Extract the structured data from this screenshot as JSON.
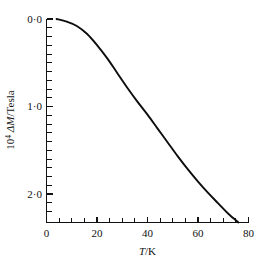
{
  "chart_data": {
    "type": "line",
    "title": "",
    "subtitle": "",
    "xlabel": "T/K",
    "xlabel_parts": {
      "symbol": "T",
      "separator": "/",
      "unit": "K"
    },
    "ylabel": "10⁴ ΔM / Tesla",
    "ylabel_parts": {
      "coefficient": "10",
      "exponent": "4",
      "quantity": "ΔM",
      "separator": "/",
      "unit": "Tesla"
    },
    "xlim": [
      0,
      80
    ],
    "ylim": [
      2.34,
      0.0
    ],
    "y_axis_inverted": true,
    "grid": false,
    "legend": false,
    "legend_position": "none",
    "xticks": [
      0,
      20,
      40,
      60,
      80
    ],
    "xticklabels": [
      "0",
      "20",
      "40",
      "60",
      "80"
    ],
    "x_minor_tick_step": 5,
    "yticks": [
      0.0,
      1.0,
      2.0
    ],
    "yticklabels": [
      "0·0",
      "1·0",
      "2·0"
    ],
    "y_minor_tick_step": 0.1,
    "axis_style": "left-and-bottom-spines",
    "curve_color": "#0d0d0d",
    "background_color": "#ffffff",
    "series": [
      {
        "name": "ΔM vs T",
        "x": [
          4,
          8,
          12,
          16,
          20,
          24,
          28,
          32,
          36,
          40,
          44,
          48,
          52,
          56,
          60,
          64,
          68,
          72,
          76
        ],
        "y": [
          0.0,
          0.03,
          0.08,
          0.17,
          0.3,
          0.45,
          0.62,
          0.79,
          0.95,
          1.1,
          1.26,
          1.42,
          1.58,
          1.73,
          1.87,
          2.0,
          2.12,
          2.24,
          2.34
        ]
      }
    ],
    "annotations": []
  }
}
